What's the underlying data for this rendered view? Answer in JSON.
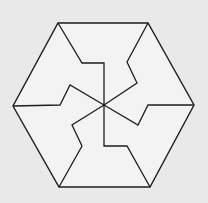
{
  "figure": {
    "colors": {
      "background": "#e9e9e9",
      "fill": "#f3f3f3",
      "stroke": "#1e1e1e"
    },
    "hexagon": [
      [
        58,
        23
      ],
      [
        148,
        23
      ],
      [
        194,
        105
      ],
      [
        150,
        187
      ],
      [
        59,
        187
      ],
      [
        13,
        106
      ]
    ],
    "center": [
      104,
      105
    ],
    "cuts": [
      [
        [
          58,
          23
        ],
        [
          82,
          63
        ],
        [
          104,
          63
        ],
        [
          104,
          105
        ]
      ],
      [
        [
          148,
          23
        ],
        [
          127,
          62
        ],
        [
          137,
          83
        ],
        [
          104,
          105
        ]
      ],
      [
        [
          194,
          105
        ],
        [
          148,
          105
        ],
        [
          138,
          125
        ],
        [
          104,
          105
        ]
      ],
      [
        [
          150,
          187
        ],
        [
          127,
          146
        ],
        [
          104,
          146
        ],
        [
          104,
          105
        ]
      ],
      [
        [
          59,
          187
        ],
        [
          82,
          146
        ],
        [
          72,
          125
        ],
        [
          104,
          105
        ]
      ],
      [
        [
          13,
          106
        ],
        [
          60,
          105
        ],
        [
          70,
          85
        ],
        [
          104,
          105
        ]
      ]
    ]
  }
}
